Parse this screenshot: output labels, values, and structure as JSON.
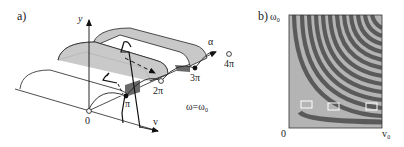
{
  "panel_a": {
    "label": "a)",
    "axis_y": "y",
    "axis_v": "v",
    "axis_alpha": "α",
    "ticks": [
      "0",
      "π",
      "2π",
      "3π",
      "4π"
    ],
    "condition": "ω=ω₀"
  },
  "panel_b": {
    "label": "b)",
    "y_max_label": "ω₀",
    "origin_label": "0",
    "x_max_label": "v₀",
    "colors": {
      "light": "#b4b4b4",
      "dark": "#5a5a5a",
      "frame": "#333333",
      "box": "#ffffff"
    }
  }
}
